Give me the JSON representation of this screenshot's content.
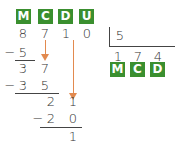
{
  "header_labels": [
    "M",
    "C",
    "D",
    "U"
  ],
  "dividend": [
    "8",
    "7",
    "1",
    "0"
  ],
  "divisor": "5",
  "quotient": [
    "1",
    "7",
    "4"
  ],
  "quotient_labels": [
    "M",
    "C",
    "D"
  ],
  "steps": {
    "sub1": {
      "sign": "−",
      "digits": [
        "5"
      ]
    },
    "rem1": [
      "3",
      "7"
    ],
    "sub2": {
      "sign": "−",
      "digits": [
        "3",
        "5"
      ]
    },
    "rem2": [
      "2",
      "1"
    ],
    "sub3": {
      "sign": "−",
      "digits": [
        "2",
        "0"
      ]
    },
    "rem3": [
      "1"
    ]
  },
  "colors": {
    "label_bg": "#3a8f2f",
    "arrow": "#e28a4f"
  }
}
